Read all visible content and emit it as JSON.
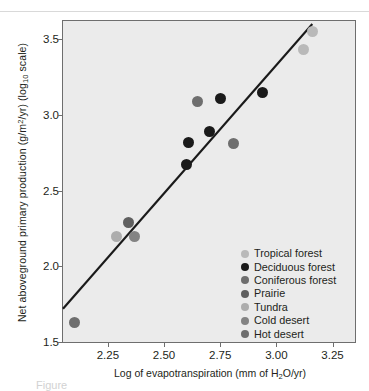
{
  "figure": {
    "caption_fragment": "Figure"
  },
  "axes": {
    "x": {
      "label_parts": {
        "pre": "Log of evapotranspiration (mm of H",
        "sub": "2",
        "post": "O/yr)"
      },
      "label_plain": "Log of evapotranspiration (mm of H2O/yr)",
      "ticks": [
        "2.25",
        "2.50",
        "2.75",
        "3.00",
        "3.25"
      ],
      "tick_values": [
        2.25,
        2.5,
        2.75,
        3.0,
        3.25
      ],
      "min": 2.05,
      "max": 3.35
    },
    "y": {
      "label_parts": {
        "pre": "Net aboveground primary production (g/m",
        "sup": "2",
        "mid": "/yr) (log",
        "sub": "10",
        "post": " scale)"
      },
      "label_plain": "Net aboveground primary production (g/m2/yr) (log10 scale)",
      "ticks": [
        "1.5",
        "2.0",
        "2.5",
        "3.0",
        "3.5"
      ],
      "tick_values": [
        1.5,
        2.0,
        2.5,
        3.0,
        3.5
      ],
      "min": 1.5,
      "max": 3.62
    }
  },
  "legend": {
    "position": "inside-bottom-right",
    "items": [
      {
        "label": "Tropical forest",
        "color": "#b9b9b9"
      },
      {
        "label": "Deciduous forest",
        "color": "#1a1a1a"
      },
      {
        "label": "Coniferous forest",
        "color": "#6e6e6e"
      },
      {
        "label": "Prairie",
        "color": "#5f5f5f"
      },
      {
        "label": "Tundra",
        "color": "#adadad"
      },
      {
        "label": "Cold desert",
        "color": "#838383"
      },
      {
        "label": "Hot desert",
        "color": "#6e6e6e"
      }
    ]
  },
  "colors": {
    "plot_background": "#ebebeb",
    "frame": "#6e6e6e",
    "trend_line": "#1a1a1a",
    "text": "#231f20",
    "page_background": "#ffffff"
  },
  "chart_data": {
    "type": "scatter",
    "title": "",
    "xlabel": "Log of evapotranspiration (mm of H2O/yr)",
    "ylabel": "Net aboveground primary production (g/m2/yr) (log10 scale)",
    "xlim": [
      2.05,
      3.35
    ],
    "ylim": [
      1.5,
      3.62
    ],
    "grid": false,
    "legend_position": "inside-bottom-right",
    "series": [
      {
        "name": "Tropical forest",
        "color": "#b9b9b9",
        "points": [
          {
            "x": 3.16,
            "y": 3.55
          },
          {
            "x": 3.12,
            "y": 3.43
          }
        ]
      },
      {
        "name": "Deciduous forest",
        "color": "#1a1a1a",
        "points": [
          {
            "x": 2.94,
            "y": 3.15
          },
          {
            "x": 2.75,
            "y": 3.11
          },
          {
            "x": 2.7,
            "y": 2.89
          },
          {
            "x": 2.61,
            "y": 2.82
          },
          {
            "x": 2.6,
            "y": 2.67
          }
        ]
      },
      {
        "name": "Coniferous forest",
        "color": "#6e6e6e",
        "points": [
          {
            "x": 2.65,
            "y": 3.09
          },
          {
            "x": 2.81,
            "y": 2.81
          }
        ]
      },
      {
        "name": "Prairie",
        "color": "#5f5f5f",
        "points": [
          {
            "x": 2.34,
            "y": 2.29
          }
        ]
      },
      {
        "name": "Tundra",
        "color": "#adadad",
        "points": [
          {
            "x": 2.29,
            "y": 2.2
          }
        ]
      },
      {
        "name": "Cold desert",
        "color": "#838383",
        "points": [
          {
            "x": 2.37,
            "y": 2.2
          }
        ]
      },
      {
        "name": "Hot desert",
        "color": "#6e6e6e",
        "points": [
          {
            "x": 2.1,
            "y": 1.63
          }
        ]
      }
    ],
    "trend_line": {
      "name": "regression line",
      "color": "#1a1a1a",
      "x1": 2.05,
      "y1": 1.72,
      "x2": 3.16,
      "y2": 3.6
    }
  }
}
